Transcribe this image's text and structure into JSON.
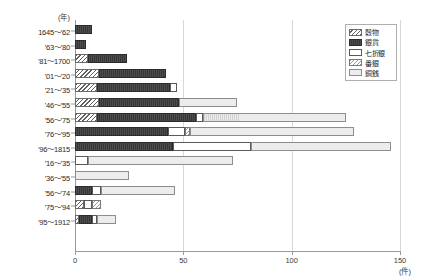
{
  "chart_data": {
    "type": "bar",
    "orientation": "horizontal",
    "stacked": true,
    "title": "",
    "xlabel": "(件)",
    "ylabel": "(年)",
    "xlim": [
      0,
      150
    ],
    "xticks": [
      0,
      50,
      100,
      150
    ],
    "xtick_labels": [
      "0",
      "50",
      "100",
      "150"
    ],
    "grid": true,
    "legend_position": "top-right",
    "categories": [
      "1645〜'62",
      "'63〜'80",
      "'81〜1700",
      "'01〜'20",
      "'21〜'35",
      "'46〜'55",
      "'56〜'75",
      "'76〜'95",
      "'96〜1815",
      "'16〜'35",
      "'36〜'55",
      "'56〜'74",
      "'75〜'94",
      "'95〜1912"
    ],
    "series": [
      {
        "name": "穀物",
        "pattern": "diagonal-hatch-dark",
        "values": [
          0,
          0,
          6,
          11,
          10,
          11,
          10,
          0,
          0,
          0,
          0,
          0,
          4,
          2
        ]
      },
      {
        "name": "銀貨",
        "pattern": "solid-dark",
        "values": [
          8,
          5,
          18,
          31,
          34,
          37,
          46,
          43,
          45,
          0,
          0,
          8,
          0,
          6
        ]
      },
      {
        "name": "七折銀",
        "pattern": "white",
        "values": [
          0,
          0,
          0,
          0,
          3,
          0,
          3,
          8,
          36,
          6,
          0,
          4,
          4,
          2
        ]
      },
      {
        "name": "番銀",
        "pattern": "diagonal-hatch-light",
        "values": [
          0,
          0,
          0,
          0,
          0,
          0,
          0,
          2,
          0,
          0,
          0,
          0,
          4,
          0
        ]
      },
      {
        "name": "銅銭",
        "pattern": "light-grid",
        "values": [
          0,
          0,
          0,
          0,
          0,
          27,
          66,
          76,
          65,
          67,
          25,
          34,
          0,
          9
        ]
      }
    ],
    "totals": [
      8,
      5,
      24,
      42,
      47,
      75,
      125,
      129,
      146,
      73,
      25,
      46,
      12,
      19
    ]
  },
  "legend": {
    "items": [
      {
        "label": "穀物",
        "key": "kokumotsu"
      },
      {
        "label": "銀貨",
        "key": "ginka"
      },
      {
        "label": "七折銀",
        "key": "nanaoregin"
      },
      {
        "label": "番銀",
        "key": "bangin"
      },
      {
        "label": "銅銭",
        "key": "dousen"
      }
    ]
  },
  "axis": {
    "y_unit": "(年)",
    "x_unit": "(件)"
  }
}
